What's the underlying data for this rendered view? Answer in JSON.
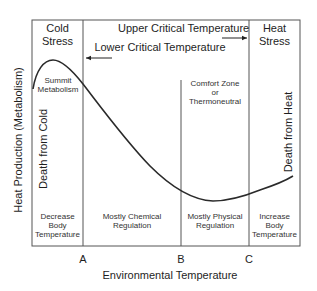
{
  "diagram": {
    "y_axis_label": "Heat Production (Metabolism)",
    "x_axis_label": "Environmental Temperature",
    "zones_top": {
      "cold": [
        "Cold",
        "Stress"
      ],
      "heat": [
        "Heat",
        "Stress"
      ]
    },
    "thresholds": {
      "upper": "Upper Critical Temperature",
      "lower": "Lower Critical Temperature"
    },
    "annotations": {
      "summit": [
        "Summit",
        "Metabolism"
      ],
      "comfort": [
        "Comfort Zone",
        "or",
        "Thermoneutral"
      ],
      "death_cold": "Death from Cold",
      "death_heat": "Death from Heat"
    },
    "zones_bottom": {
      "decrease": [
        "Decrease",
        "Body",
        "Temperature"
      ],
      "chemical": [
        "Mostly Chemical",
        "Regulation"
      ],
      "physical": [
        "Mostly Physical",
        "Regulation"
      ],
      "increase": [
        "Increase",
        "Body",
        "Temperature"
      ]
    },
    "markers": [
      "A",
      "B",
      "C"
    ],
    "colors": {
      "line": "#2a2a2a",
      "frame": "#555555",
      "text": "#222222"
    }
  }
}
